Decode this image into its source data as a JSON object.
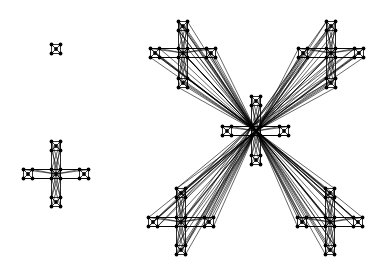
{
  "diagram": {
    "type": "network-graph",
    "background": "#ffffff",
    "edge_color": "#000000",
    "node_color": "#000000",
    "motif": {
      "description": "5-node unit: center node plus 4 corner nodes, square + diagonals",
      "corner_offset": 4.5,
      "node_radius": 1.9
    },
    "components": [
      {
        "id": "isolated-unit",
        "center": [
          56,
          49
        ],
        "satellites": [],
        "hub_links": false
      },
      {
        "id": "small-cross",
        "center": [
          56,
          174
        ],
        "satellites": [
          [
            56,
            146
          ],
          [
            56,
            202
          ],
          [
            28,
            174
          ],
          [
            84,
            174
          ]
        ],
        "hub_links": false
      },
      {
        "id": "large-star",
        "center": [
          256,
          131
        ],
        "satellites": [
          [
            256,
            101
          ],
          [
            256,
            160
          ],
          [
            227,
            131
          ],
          [
            284,
            131
          ]
        ],
        "sub_crosses": [
          {
            "center": [
              183,
              53
            ],
            "satellites": [
              [
                183,
                26
              ],
              [
                183,
                83
              ],
              [
                155,
                53
              ],
              [
                211,
                53
              ]
            ]
          },
          {
            "center": [
              331,
              53
            ],
            "satellites": [
              [
                331,
                26
              ],
              [
                331,
                83
              ],
              [
                303,
                53
              ],
              [
                359,
                53
              ]
            ]
          },
          {
            "center": [
              181,
              222
            ],
            "satellites": [
              [
                181,
                193
              ],
              [
                181,
                250
              ],
              [
                153,
                222
              ],
              [
                209,
                222
              ]
            ]
          },
          {
            "center": [
              330,
              222
            ],
            "satellites": [
              [
                330,
                193
              ],
              [
                330,
                250
              ],
              [
                302,
                222
              ],
              [
                358,
                222
              ]
            ]
          }
        ],
        "hub_links": true
      }
    ]
  }
}
